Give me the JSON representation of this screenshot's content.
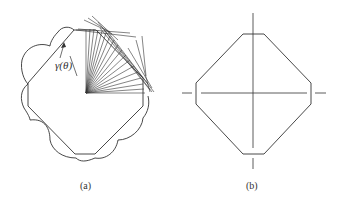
{
  "panels": [
    {
      "id": "a",
      "caption": "(a)",
      "annotation": "γ(θ)",
      "description": "Octagonal Wulff shape with polar plot of surface energy gamma(theta) shown as lobed curve and fan of radial lines from center"
    },
    {
      "id": "b",
      "caption": "(b)",
      "description": "Truncated square (octagon) equilibrium crystal shape with crossed symmetry axes"
    }
  ],
  "colors": {
    "stroke": "#333333",
    "background": "#ffffff"
  }
}
